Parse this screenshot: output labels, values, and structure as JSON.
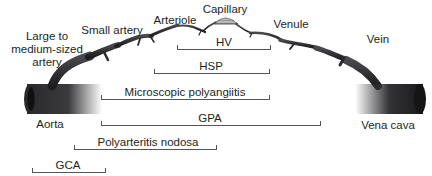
{
  "diagram": {
    "type": "vasculitis-vessel-size-spectrum",
    "vessels": [
      {
        "id": "large-medium-artery",
        "label_lines": [
          "Large to",
          "medium-sized",
          "artery"
        ]
      },
      {
        "id": "small-artery",
        "label": "Small artery"
      },
      {
        "id": "arteriole",
        "label": "Arteriole"
      },
      {
        "id": "capillary",
        "label": "Capillary"
      },
      {
        "id": "venule",
        "label": "Venule"
      },
      {
        "id": "vein",
        "label": "Vein"
      },
      {
        "id": "aorta",
        "label": "Aorta"
      },
      {
        "id": "vena-cava",
        "label": "Vena cava"
      }
    ],
    "ranges": [
      {
        "label": "HV",
        "x_start": 177,
        "x_end": 270,
        "y": 49
      },
      {
        "label": "HSP",
        "x_start": 154,
        "x_end": 269,
        "y": 73
      },
      {
        "label": "Microscopic polyangiitis",
        "x_start": 101,
        "x_end": 269,
        "y": 99
      },
      {
        "label": "GPA",
        "x_start": 101,
        "x_end": 320,
        "y": 125
      },
      {
        "label": "Polyarteritis nodosa",
        "x_start": 74,
        "x_end": 216,
        "y": 149
      },
      {
        "label": "GCA",
        "x_start": 32,
        "x_end": 105,
        "y": 172
      }
    ],
    "colors": {
      "vessel_dark": "#1c1c1e",
      "vessel_mid": "#4a4a4e",
      "line": "#555555",
      "text": "#231f20"
    }
  }
}
